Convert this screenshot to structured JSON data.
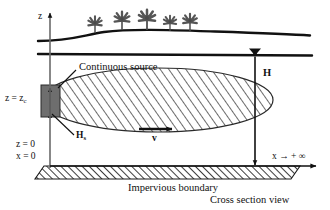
{
  "figure": {
    "title": "Cross section view",
    "caption_bottom": "Impervious boundary",
    "view_label": "Cross section view"
  },
  "axes": {
    "z_axis_label": "z",
    "x_axis_label": "x",
    "x_infinity_label": "x → + ∞",
    "origin_z": "z = 0",
    "origin_x": "x = 0"
  },
  "annotations": {
    "continuous_source": "Continuous source",
    "source_height": "H",
    "source_height_sub": "s",
    "source_elevation": "z = z",
    "source_elevation_sub": "c",
    "aquifer_thickness": "H",
    "velocity": "v"
  },
  "colors": {
    "line": "#111111",
    "source_fill": "#6e6e6e",
    "plume_fill": "#ffffff",
    "hatch": "#3a3a3a",
    "tree": "#555555",
    "ground": "#111111"
  },
  "geometry": {
    "ground_surface": "wavy-line",
    "water_table": "straight-line",
    "plume_shape": "hatched-ellipse",
    "impervious_boundary": "hatched-band",
    "tree_count": 5
  }
}
